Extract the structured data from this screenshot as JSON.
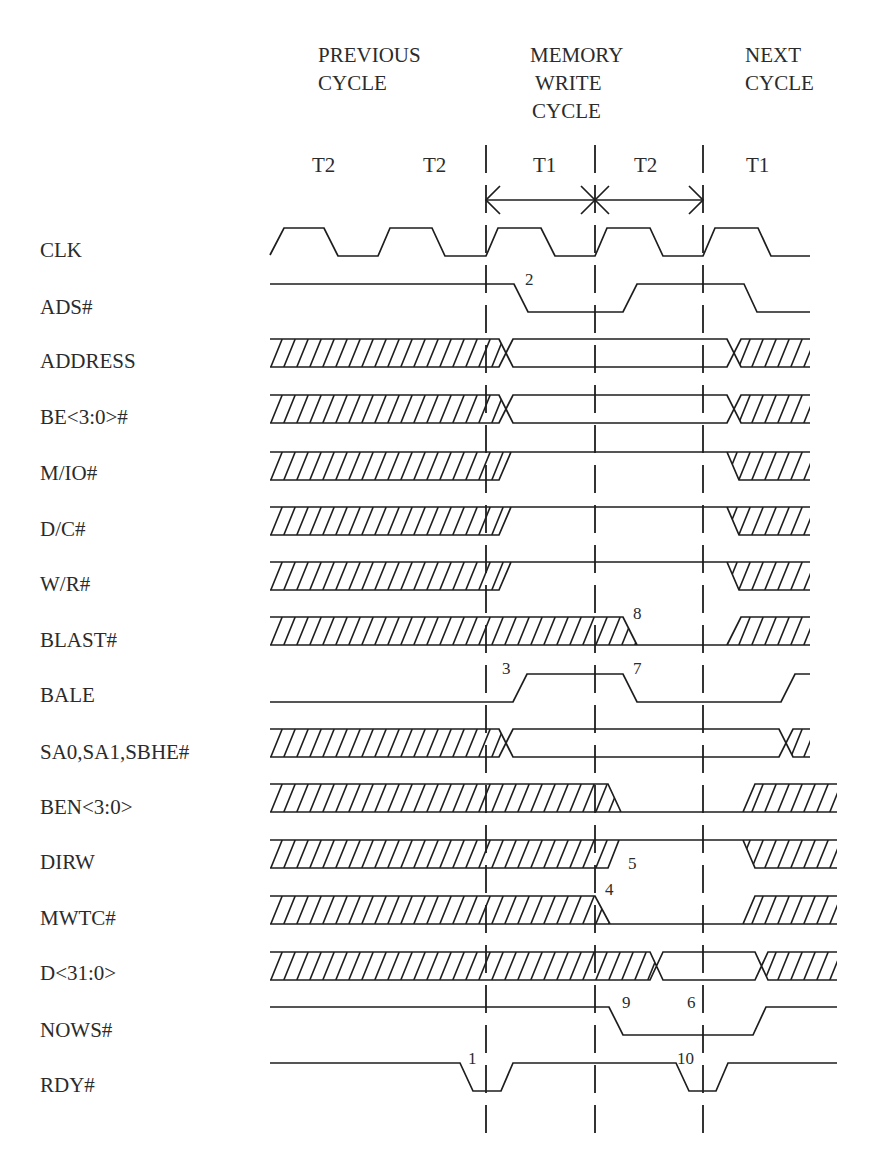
{
  "diagram": {
    "phases": [
      {
        "lines": [
          "PREVIOUS",
          "CYCLE"
        ]
      },
      {
        "lines": [
          "MEMORY",
          "WRITE",
          "CYCLE"
        ]
      },
      {
        "lines": [
          "NEXT",
          "CYCLE"
        ]
      }
    ],
    "states": [
      "T2",
      "T2",
      "T1",
      "T2",
      "T1"
    ],
    "signals": [
      {
        "name": "CLK",
        "wave": "M270,27 L284,0 L324,0 L338,28 L378,28 L390,0 L432,0 L445,28 L486,28 L498,0 L541,0 L555,28 L595,28 L607,0 L650,0 L663,28 L703,28 L715,0 L758,0 L771,28 L810,28"
      },
      {
        "name": "ADS#",
        "wave": "M270,0 L514,0 L528,28 L623,28 L637,0 L744,0 L757,28 L810,28"
      },
      {
        "name": "ADDRESS",
        "wave": "M270,0 L499,0 L513,28 L727,28 L741,0 L810,0 M270,28 L499,28 L513,0 L727,0 L741,28 L810,28",
        "hatch": [
          "270,0 499,0 506,14 499,28 270,28",
          "734,14 741,0 810,0 810,28 741,28"
        ]
      },
      {
        "name": "BE<3:0>#",
        "wave": "M270,0 L499,0 L513,28 L727,28 L741,0 L810,0 M270,28 L499,28 L513,0 L727,0 L741,28 L810,28",
        "hatch": [
          "270,0 499,0 506,14 499,28 270,28",
          "734,14 741,0 810,0 810,28 741,28"
        ]
      },
      {
        "name": "M/IO#",
        "wave": "M270,0 L810,0 M270,28 L499,28 L511,0 M727,0 L739,28 L810,28",
        "hatch": [
          "270,0 511,0 499,28 270,28",
          "727,0 810,0 810,28 739,28"
        ]
      },
      {
        "name": "D/C#",
        "wave": "M270,0 L810,0 M270,28 L499,28 L511,0 M727,0 L739,28 L810,28",
        "hatch": [
          "270,0 511,0 499,28 270,28",
          "727,0 810,0 810,28 739,28"
        ]
      },
      {
        "name": "W/R#",
        "wave": "M270,0 L810,0 M270,28 L499,28 L511,0 M727,0 L739,28 L810,28",
        "hatch": [
          "270,0 511,0 499,28 270,28",
          "727,0 810,0 810,28 739,28"
        ]
      },
      {
        "name": "BLAST#",
        "wave": "M270,0 L623,0 L637,28 M270,28 L810,28 M727,28 L741,0 L810,0",
        "hatch": [
          "270,0 623,0 637,28 270,28",
          "741,0 810,0 810,28 727,28"
        ]
      },
      {
        "name": "BALE",
        "wave": "M270,28 L513,28 L527,0 L623,0 L637,28 L781,28 L795,0 L810,0"
      },
      {
        "name": "SA0,SA1,SBHE#",
        "wave": "M270,0 L499,0 L513,28 L779,28 L793,0 L810,0 M270,28 L499,28 L513,0 L779,0 L793,28 L810,28",
        "hatch": [
          "270,0 499,0 506,14 499,28 270,28",
          "786,14 793,0 810,0 810,28 793,28"
        ]
      },
      {
        "name": "BEN<3:0>",
        "wave": "M270,0 L608,0 L621,28 M270,28 L837,28 M743,28 L755,0 L837,0",
        "hatch": [
          "270,0 608,0 621,28 270,28",
          "755,0 837,0 837,28 743,28"
        ]
      },
      {
        "name": "DIRW",
        "wave": "M270,0 L837,0 M270,28 L608,28 L619,0 M743,0 L755,28 L837,28",
        "hatch": [
          "270,0 619,0 608,28 270,28",
          "743,0 837,0 837,28 755,28"
        ]
      },
      {
        "name": "MWTC#",
        "wave": "M270,0 L595,0 L610,28 M270,28 L837,28 M743,28 L755,0 L837,0",
        "hatch": [
          "270,0 595,0 610,28 270,28",
          "755,0 837,0 837,28 743,28"
        ]
      },
      {
        "name": "D<31:0>",
        "wave": "M270,0 L650,0 L663,28 L755,28 L768,0 L837,0 M270,28 L650,28 L663,0 L755,0 L768,28 L837,28",
        "hatch": [
          "270,0 650,0 656,14 650,28 270,28",
          "761,14 768,0 837,0 837,28 768,28"
        ]
      },
      {
        "name": "NOWS#",
        "wave": "M270,0 L609,0 L623,28 L753,28 L766,0 L837,0"
      },
      {
        "name": "RDY#",
        "wave": "M270,0 L460,0 L473,28 L501,28 L513,0 L676,0 L689,28 L716,28 L728,0 L837,0"
      }
    ],
    "annotations": [
      "1",
      "2",
      "3",
      "4",
      "5",
      "6",
      "7",
      "8",
      "9",
      "10"
    ],
    "cycle_arrow": {
      "line": "M486,200 L703,200",
      "left_head": "M500,186 L486,200 L500,214",
      "mid_cross": "M581,186 L609,214 M581,214 L609,186",
      "right_head": "M689,186 L703,200 L689,214"
    },
    "colors": {
      "line": "#1e1e1e",
      "text": "#2b2b2b",
      "background": "#ffffff"
    }
  }
}
